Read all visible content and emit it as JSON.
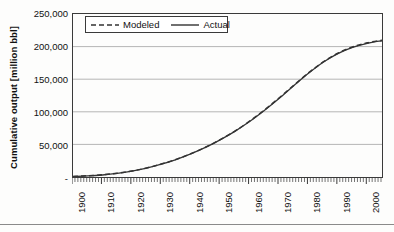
{
  "chart_data": {
    "type": "line",
    "title": "",
    "subtitle": "",
    "xlabel": "",
    "ylabel": "Cumulative output [million bbl]",
    "xlim": [
      1900,
      2005
    ],
    "ylim": [
      0,
      250000
    ],
    "grid": "horizontal",
    "legend_position": "top-left-inside",
    "x_tick_labels": [
      "1900",
      "1910",
      "1920",
      "1930",
      "1940",
      "1950",
      "1960",
      "1970",
      "1980",
      "1990",
      "2000"
    ],
    "x_tick_values": [
      1900,
      1910,
      1920,
      1930,
      1940,
      1950,
      1960,
      1970,
      1980,
      1990,
      2000
    ],
    "x_minor_tick_interval": 1,
    "y_tick_labels": [
      "-",
      "50,000",
      "100,000",
      "150,000",
      "200,000",
      "250,000"
    ],
    "y_tick_values": [
      0,
      50000,
      100000,
      150000,
      200000,
      250000
    ],
    "x": [
      1900,
      1905,
      1910,
      1915,
      1920,
      1925,
      1930,
      1935,
      1940,
      1945,
      1950,
      1955,
      1960,
      1965,
      1970,
      1975,
      1980,
      1985,
      1990,
      1995,
      2000,
      2005
    ],
    "series": [
      {
        "name": "Modeled",
        "style": "dashed",
        "color": "#333333",
        "values": [
          900,
          1900,
          3400,
          5800,
          9200,
          13800,
          19800,
          27000,
          35600,
          45600,
          57200,
          70400,
          85600,
          102600,
          121200,
          140600,
          159600,
          176400,
          189800,
          199400,
          205800,
          209800
        ]
      },
      {
        "name": "Actual",
        "style": "solid",
        "color": "#333333",
        "values": [
          700,
          1600,
          3100,
          5500,
          9000,
          13600,
          19600,
          26800,
          35400,
          45400,
          57000,
          70000,
          85000,
          102000,
          120400,
          140000,
          159000,
          176000,
          189200,
          198800,
          205000,
          209000
        ]
      }
    ]
  },
  "legend": {
    "modeled_label": "Modeled",
    "actual_label": "Actual"
  },
  "axes": {
    "y_title": "Cumulative output [million bbl]",
    "y_ticks": [
      "250,000",
      "200,000",
      "150,000",
      "100,000",
      "50,000",
      "-"
    ],
    "x_ticks": [
      "1900",
      "1910",
      "1920",
      "1930",
      "1940",
      "1950",
      "1960",
      "1970",
      "1980",
      "1990",
      "2000"
    ]
  },
  "colors": {
    "line": "#333333",
    "gridline": "#b6b6b6",
    "axis": "#3a3a3a",
    "background": "#fdfdfc"
  }
}
